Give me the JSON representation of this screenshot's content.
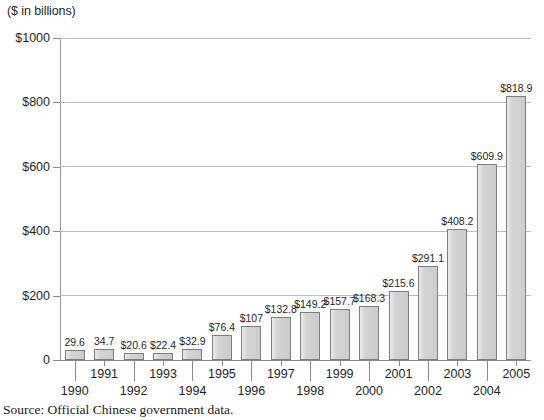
{
  "chart_data": {
    "type": "bar",
    "title": "($ in billions)",
    "xlabel": "",
    "ylabel": "($ in billions)",
    "ylim": [
      0,
      1000
    ],
    "grid": true,
    "legend": "none",
    "categories": [
      "1990",
      "1991",
      "1992",
      "1993",
      "1994",
      "1995",
      "1996",
      "1997",
      "1998",
      "1999",
      "2000",
      "2001",
      "2002",
      "2003",
      "2004",
      "2005"
    ],
    "values": [
      29.6,
      34.7,
      20.6,
      22.4,
      32.9,
      76.4,
      107,
      132.8,
      149.2,
      157.7,
      168.3,
      215.6,
      291.1,
      408.2,
      609.9,
      818.9
    ],
    "data_labels": [
      "29.6",
      "34.7",
      "$20.6",
      "$22.4",
      "$32.9",
      "$76.4",
      "$107",
      "$132.8",
      "$149.2",
      "$157.7",
      "$168.3",
      "$215.6",
      "$291.1",
      "$408.2",
      "$609.9",
      "$818.9"
    ],
    "y_ticks": [
      0,
      200,
      400,
      600,
      800,
      1000
    ],
    "y_tick_labels": [
      "0",
      "$200",
      "$400",
      "$600",
      "$800",
      "$1000"
    ],
    "source_note": "Source: Official Chinese government data.",
    "bar_color": "#d3d3d3",
    "bar_border_color": "#7d7d7d",
    "grid_color": "#bcbcbc",
    "axis_color": "#8a8a8a",
    "text_color": "#1f1f1f"
  }
}
